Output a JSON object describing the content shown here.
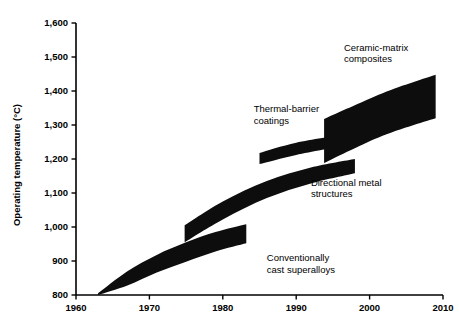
{
  "chart_data": {
    "type": "area",
    "title": "",
    "xlabel": "",
    "ylabel": "Operating temperature (°C)",
    "xlim": [
      1960,
      2010
    ],
    "ylim": [
      800,
      1600
    ],
    "grid": false,
    "legend": "none",
    "xticks": [
      "1960",
      "1970",
      "1980",
      "1990",
      "2000",
      "2010"
    ],
    "xtick_values": [
      1960,
      1970,
      1980,
      1990,
      2000,
      2010
    ],
    "yticks": [
      "800",
      "900",
      "1,000",
      "1,100",
      "1,200",
      "1,300",
      "1,400",
      "1,500",
      "1,600"
    ],
    "ytick_values": [
      800,
      900,
      1000,
      1100,
      1200,
      1300,
      1400,
      1500,
      1600
    ],
    "series": [
      {
        "name": "Conventionally cast superalloys",
        "x_start": 1963,
        "x_end": 1983.2,
        "upper": [
          {
            "x": 1963.0,
            "y": 805
          },
          {
            "x": 1967.0,
            "y": 870
          },
          {
            "x": 1971.0,
            "y": 918
          },
          {
            "x": 1975.0,
            "y": 955
          },
          {
            "x": 1979.0,
            "y": 985
          },
          {
            "x": 1983.2,
            "y": 1008
          }
        ],
        "lower": [
          {
            "x": 1963.0,
            "y": 800
          },
          {
            "x": 1967.0,
            "y": 828
          },
          {
            "x": 1971.0,
            "y": 866
          },
          {
            "x": 1975.0,
            "y": 898
          },
          {
            "x": 1979.0,
            "y": 928
          },
          {
            "x": 1983.2,
            "y": 952
          }
        ]
      },
      {
        "name": "Directional metal structures",
        "x_start": 1974.8,
        "x_end": 1998.0,
        "upper": [
          {
            "x": 1974.8,
            "y": 1005
          },
          {
            "x": 1980.0,
            "y": 1075
          },
          {
            "x": 1986.0,
            "y": 1135
          },
          {
            "x": 1992.0,
            "y": 1175
          },
          {
            "x": 1998.0,
            "y": 1200
          }
        ],
        "lower": [
          {
            "x": 1974.8,
            "y": 955
          },
          {
            "x": 1980.0,
            "y": 1022
          },
          {
            "x": 1986.0,
            "y": 1085
          },
          {
            "x": 1992.0,
            "y": 1128
          },
          {
            "x": 1998.0,
            "y": 1158
          }
        ]
      },
      {
        "name": "Thermal-barrier coatings",
        "x_start": 1985.0,
        "x_end": 1996.5,
        "upper": [
          {
            "x": 1985.0,
            "y": 1218
          },
          {
            "x": 1990.0,
            "y": 1248
          },
          {
            "x": 1996.5,
            "y": 1272
          }
        ],
        "lower": [
          {
            "x": 1985.0,
            "y": 1185
          },
          {
            "x": 1990.0,
            "y": 1212
          },
          {
            "x": 1996.5,
            "y": 1238
          }
        ]
      },
      {
        "name": "Ceramic-matrix composites",
        "x_start": 1993.8,
        "x_end": 2009.0,
        "upper": [
          {
            "x": 1993.8,
            "y": 1318
          },
          {
            "x": 1999.0,
            "y": 1368
          },
          {
            "x": 2003.5,
            "y": 1408
          },
          {
            "x": 2009.0,
            "y": 1448
          }
        ],
        "lower": [
          {
            "x": 1993.8,
            "y": 1188
          },
          {
            "x": 1999.0,
            "y": 1242
          },
          {
            "x": 2003.5,
            "y": 1282
          },
          {
            "x": 2009.0,
            "y": 1320
          }
        ]
      }
    ],
    "annotations": [
      {
        "id": "ceramic",
        "lines": [
          "Ceramic-matrix",
          "composites"
        ],
        "x": 1996.5,
        "y": 1518
      },
      {
        "id": "thermal",
        "lines": [
          "Thermal-barrier",
          "coatings"
        ],
        "x": 1984.2,
        "y": 1338
      },
      {
        "id": "directional",
        "lines": [
          "Directional metal",
          "structures"
        ],
        "x": 1992.0,
        "y": 1122
      },
      {
        "id": "conventional",
        "lines": [
          "Conventionally",
          "cast superalloys"
        ],
        "x": 1986.0,
        "y": 900
      }
    ]
  },
  "colors": {
    "band": "#0d0d0d",
    "axis": "#000000",
    "background": "#ffffff"
  }
}
